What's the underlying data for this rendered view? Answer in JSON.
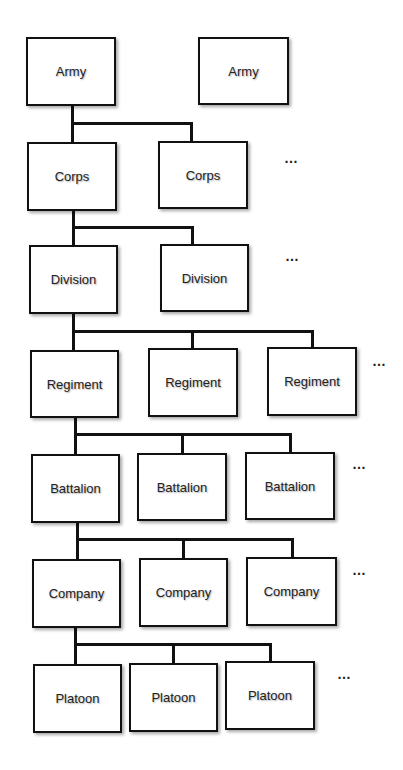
{
  "diagram": {
    "ellipsis": "…",
    "levels": [
      {
        "name": "army",
        "nodes": [
          {
            "label": "Army",
            "x": 26,
            "y": 37,
            "w": 90,
            "h": 69
          },
          {
            "label": "Army",
            "x": 198,
            "y": 37,
            "w": 91,
            "h": 68
          }
        ],
        "dots": null
      },
      {
        "name": "corps",
        "nodes": [
          {
            "label": "Corps",
            "x": 27,
            "y": 142,
            "w": 90,
            "h": 69
          },
          {
            "label": "Corps",
            "x": 158,
            "y": 141,
            "w": 90,
            "h": 68
          }
        ],
        "dots": {
          "x": 284,
          "y": 150
        }
      },
      {
        "name": "division",
        "nodes": [
          {
            "label": "Division",
            "x": 29,
            "y": 245,
            "w": 89,
            "h": 69
          },
          {
            "label": "Division",
            "x": 160,
            "y": 244,
            "w": 89,
            "h": 68
          }
        ],
        "dots": {
          "x": 285,
          "y": 248
        }
      },
      {
        "name": "regiment",
        "nodes": [
          {
            "label": "Regiment",
            "x": 30,
            "y": 350,
            "w": 89,
            "h": 68
          },
          {
            "label": "Regiment",
            "x": 148,
            "y": 348,
            "w": 90,
            "h": 69
          },
          {
            "label": "Regiment",
            "x": 267,
            "y": 347,
            "w": 90,
            "h": 69
          }
        ],
        "dots": {
          "x": 372,
          "y": 353
        }
      },
      {
        "name": "battalion",
        "nodes": [
          {
            "label": "Battalion",
            "x": 31,
            "y": 454,
            "w": 89,
            "h": 69
          },
          {
            "label": "Battalion",
            "x": 137,
            "y": 453,
            "w": 90,
            "h": 68
          },
          {
            "label": "Battalion",
            "x": 245,
            "y": 452,
            "w": 90,
            "h": 68
          }
        ],
        "dots": {
          "x": 352,
          "y": 456
        }
      },
      {
        "name": "company",
        "nodes": [
          {
            "label": "Company",
            "x": 32,
            "y": 559,
            "w": 89,
            "h": 69
          },
          {
            "label": "Company",
            "x": 139,
            "y": 558,
            "w": 89,
            "h": 69
          },
          {
            "label": "Company",
            "x": 246,
            "y": 557,
            "w": 91,
            "h": 69
          }
        ],
        "dots": {
          "x": 352,
          "y": 562
        }
      },
      {
        "name": "platoon",
        "nodes": [
          {
            "label": "Platoon",
            "x": 33,
            "y": 664,
            "w": 89,
            "h": 69
          },
          {
            "label": "Platoon",
            "x": 129,
            "y": 663,
            "w": 89,
            "h": 69
          },
          {
            "label": "Platoon",
            "x": 225,
            "y": 661,
            "w": 90,
            "h": 69
          }
        ],
        "dots": {
          "x": 337,
          "y": 666
        }
      }
    ],
    "connectors": [
      {
        "from": [
          72,
          106
        ],
        "bus_y": 123,
        "drops": [
          72,
          191
        ],
        "to_y": [
          142,
          141
        ]
      },
      {
        "from": [
          73,
          211
        ],
        "bus_y": 227,
        "drops": [
          73,
          192
        ],
        "to_y": [
          245,
          244
        ]
      },
      {
        "from": [
          73,
          314
        ],
        "bus_y": 331,
        "drops": [
          73,
          192,
          312
        ],
        "to_y": [
          350,
          348,
          347
        ]
      },
      {
        "from": [
          75,
          418
        ],
        "bus_y": 434,
        "drops": [
          75,
          182,
          290
        ],
        "to_y": [
          454,
          453,
          452
        ]
      },
      {
        "from": [
          77,
          523
        ],
        "bus_y": 539,
        "drops": [
          77,
          183,
          292
        ],
        "to_y": [
          559,
          558,
          557
        ]
      },
      {
        "from": [
          75,
          628
        ],
        "bus_y": 644,
        "drops": [
          75,
          173,
          270
        ],
        "to_y": [
          664,
          663,
          661
        ]
      }
    ]
  }
}
